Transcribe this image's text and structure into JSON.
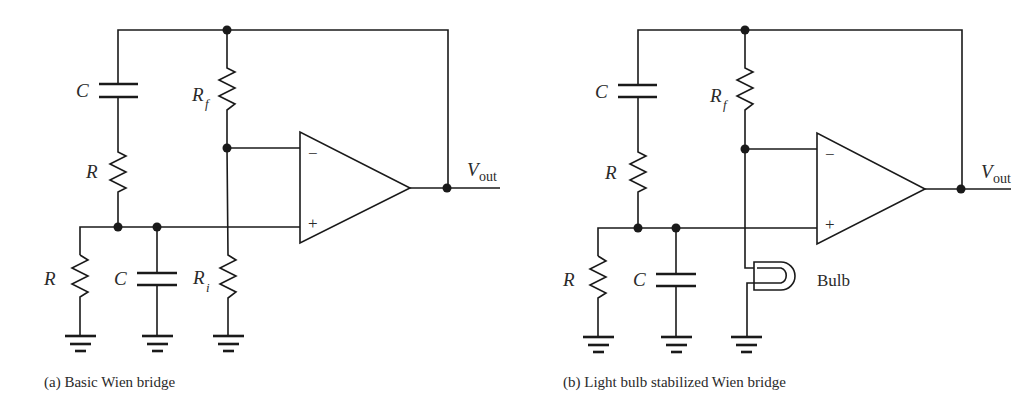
{
  "figure": {
    "panels": [
      {
        "id": "a",
        "caption": "(a) Basic Wien bridge",
        "labels": {
          "series_cap": "C",
          "series_res": "R",
          "shunt_res": "R",
          "shunt_cap": "C",
          "feedback_res": "R",
          "feedback_res_sub": "f",
          "ground_res": "R",
          "ground_res_sub": "i",
          "inverting": "−",
          "noninverting": "+",
          "output": "V",
          "output_sub": "out"
        }
      },
      {
        "id": "b",
        "caption": "(b) Light bulb stabilized Wien bridge",
        "labels": {
          "series_cap": "C",
          "series_res": "R",
          "shunt_res": "R",
          "shunt_cap": "C",
          "feedback_res": "R",
          "feedback_res_sub": "f",
          "bulb": "Bulb",
          "inverting": "−",
          "noninverting": "+",
          "output": "V",
          "output_sub": "out"
        }
      }
    ],
    "colors": {
      "ink": "#1a1a1a",
      "background": "#ffffff"
    }
  }
}
